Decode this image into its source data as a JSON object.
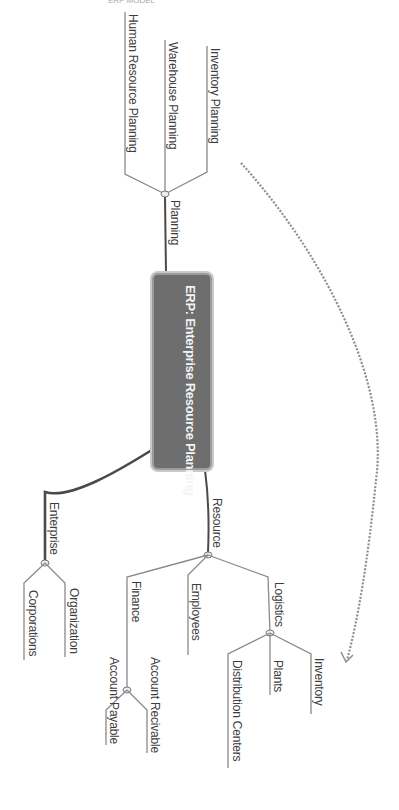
{
  "header": {
    "clipped_text": "ERP MODEL"
  },
  "diagram": {
    "type": "mind-map",
    "orientation": "rotated 90deg clockwise",
    "central_topic": "ERP: Enterprise Resource Planning",
    "colors": {
      "central_fill": "#6e6e6e",
      "central_border": "#9b9b9b",
      "central_text": "#f4f4f4",
      "line": "#555555",
      "leaf_line": "#8a8a8a",
      "dashed_arrow": "#8f8f8f",
      "label_text": "#3d3d3d"
    },
    "branches": [
      {
        "label": "Planning",
        "children": [
          {
            "label": "Inventory Planning"
          },
          {
            "label": "Warehouse Planning"
          },
          {
            "label": "Human Resource Planning"
          }
        ]
      },
      {
        "label": "Resource",
        "children": [
          {
            "label": "Logistics",
            "children": [
              {
                "label": "Inventory"
              },
              {
                "label": "Plants"
              },
              {
                "label": "Distribution Centers"
              }
            ]
          },
          {
            "label": "Employees"
          },
          {
            "label": "Finance",
            "children": [
              {
                "label": "Account Recivable"
              },
              {
                "label": "Account Payable"
              }
            ]
          }
        ]
      },
      {
        "label": "Enterprise",
        "children": [
          {
            "label": "Organization"
          },
          {
            "label": "Corporations"
          }
        ]
      }
    ],
    "relationships": [
      {
        "from": "Inventory Planning",
        "to": "Inventory",
        "style": "dashed-arrow"
      }
    ]
  }
}
